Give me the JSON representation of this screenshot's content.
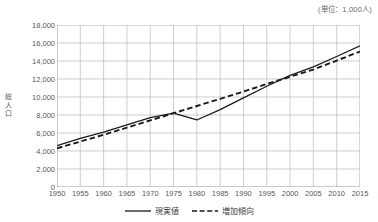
{
  "unit_note": "(単位：1,000人)",
  "axis": {
    "y_title": "総\n人\n口",
    "y_ticks": [
      "0",
      "2,000",
      "4,000",
      "6,000",
      "8,000",
      "10,000",
      "12,000",
      "14,000",
      "16,000",
      "18,000"
    ],
    "x_ticks": [
      "1950",
      "1955",
      "1960",
      "1965",
      "1970",
      "1975",
      "1980",
      "1985",
      "1990",
      "1995",
      "2000",
      "2005",
      "2010",
      "2015"
    ]
  },
  "legend": {
    "actual_label": "現実値",
    "trend_label": "増加傾向"
  },
  "colors": {
    "line": "#1a1a1a",
    "grid": "#b9b9bb",
    "axis": "#8c8c8e",
    "text": "#58585a"
  },
  "chart_data": {
    "type": "line",
    "title": "",
    "xlabel": "",
    "ylabel": "総人口",
    "unit": "1,000人",
    "xlim": [
      1950,
      2015
    ],
    "ylim": [
      0,
      18000
    ],
    "ytick_step": 2000,
    "grid": true,
    "legend_position": "bottom-center",
    "x": [
      1950,
      1955,
      1960,
      1965,
      1970,
      1975,
      1980,
      1985,
      1990,
      1995,
      2000,
      2005,
      2010,
      2015
    ],
    "series": [
      {
        "name": "現実値",
        "style": "solid",
        "values": [
          4600,
          5400,
          6100,
          6900,
          7700,
          8200,
          7450,
          8600,
          9900,
          11200,
          12400,
          13350,
          14500,
          15700
        ]
      },
      {
        "name": "増加傾向",
        "style": "dashed",
        "values": [
          4300,
          5050,
          5800,
          6600,
          7400,
          8200,
          9000,
          9800,
          10600,
          11450,
          12250,
          13050,
          14050,
          15050
        ]
      }
    ]
  }
}
